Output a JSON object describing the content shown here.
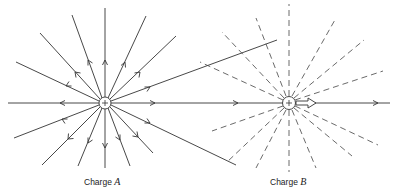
{
  "charges": [
    {
      "id": "A",
      "label_prefix": "Charge",
      "label_var": "A",
      "sign": "+",
      "cx": 105,
      "cy": 103,
      "field_line_style": "solid",
      "line_count": 16
    },
    {
      "id": "B",
      "label_prefix": "Charge",
      "label_var": "B",
      "sign": "+",
      "cx": 289,
      "cy": 103,
      "field_line_style": "dashed",
      "line_count": 16
    }
  ],
  "annotations": {
    "force_arrow_on_B": "hollow arrow pointing right (force on B)",
    "field_lines_from_A_crossing_B_region": 3
  },
  "colors": {
    "line": "#333333",
    "background": "#ffffff"
  }
}
